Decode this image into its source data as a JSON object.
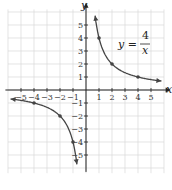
{
  "chart_data": {
    "type": "line",
    "title": "",
    "equation": {
      "lhs": "y =",
      "numerator": "4",
      "denominator": "x"
    },
    "xlabel": "x",
    "ylabel": "y",
    "xlim": [
      -6,
      6
    ],
    "ylim": [
      -6,
      6
    ],
    "grid": true,
    "x_ticks": [
      -5,
      -4,
      -3,
      -2,
      -1,
      1,
      2,
      3,
      4,
      5
    ],
    "y_ticks": [
      -5,
      -4,
      -3,
      -2,
      -1,
      1,
      2,
      3,
      4,
      5
    ],
    "x_tick_labels": [
      "−5",
      "−4",
      "−3",
      "−2",
      "−1",
      "1",
      "2",
      "3",
      "4",
      "5"
    ],
    "y_tick_labels": [
      "−5",
      "−4",
      "−3",
      "−2",
      "−1",
      "1",
      "2",
      "3",
      "4",
      "5"
    ],
    "series": [
      {
        "name": "y = 4/x (x > 0)",
        "points": [
          [
            1,
            4
          ],
          [
            2,
            2
          ],
          [
            4,
            1
          ]
        ],
        "x_range": [
          0.7,
          5.8
        ]
      },
      {
        "name": "y = 4/x (x < 0)",
        "points": [
          [
            -1,
            -4
          ],
          [
            -2,
            -2
          ],
          [
            -4,
            -1
          ]
        ],
        "x_range": [
          -5.8,
          -0.7
        ]
      }
    ],
    "colors": {
      "curve": "#444444",
      "grid": "#d8d8d8",
      "axis": "#222222"
    }
  }
}
